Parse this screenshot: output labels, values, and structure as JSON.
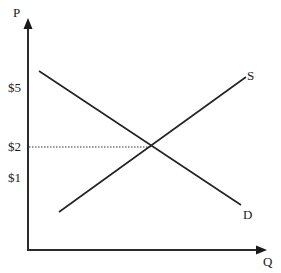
{
  "diagram": {
    "type": "supply-demand",
    "axes": {
      "y_label": "P",
      "x_label": "Q"
    },
    "price_ticks": [
      {
        "label": "$5",
        "y": 88
      },
      {
        "label": "$2",
        "y": 147
      },
      {
        "label": "$1",
        "y": 177
      }
    ],
    "curves": {
      "supply_label": "S",
      "demand_label": "D"
    },
    "equilibrium": {
      "price_label": "$2"
    }
  }
}
